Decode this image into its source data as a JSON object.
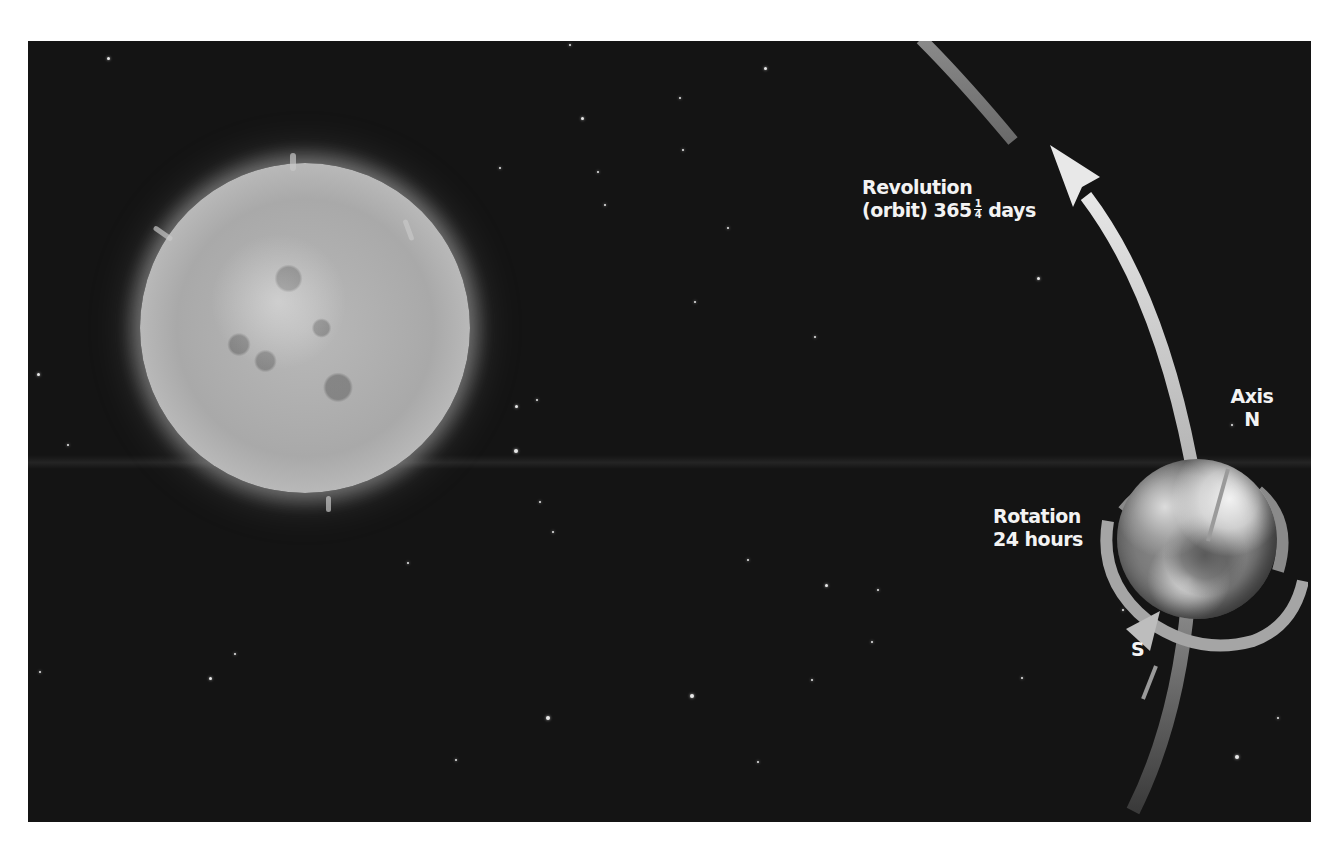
{
  "diagram": {
    "background_color": "#141414",
    "page_color": "#ffffff",
    "bodies": [
      {
        "name": "Sun",
        "icon": "sun-icon"
      },
      {
        "name": "Earth",
        "icon": "earth-icon"
      }
    ]
  },
  "labels": {
    "revolution": {
      "line1": "Revolution",
      "line2_prefix": "(orbit) 365",
      "fraction_numerator": "1",
      "fraction_denominator": "4",
      "line2_suffix": "days"
    },
    "rotation": {
      "line1": "Rotation",
      "line2": "24 hours"
    },
    "axis": {
      "title": "Axis",
      "north": "N",
      "south": "S"
    }
  },
  "stars": [
    [
      108,
      58,
      3
    ],
    [
      570,
      45,
      2
    ],
    [
      765,
      68,
      3
    ],
    [
      582,
      118,
      3
    ],
    [
      680,
      98,
      2
    ],
    [
      500,
      168,
      2
    ],
    [
      598,
      172,
      2
    ],
    [
      683,
      150,
      2
    ],
    [
      605,
      205,
      2
    ],
    [
      728,
      228,
      2
    ],
    [
      1038,
      278,
      3
    ],
    [
      695,
      302,
      2
    ],
    [
      815,
      337,
      2
    ],
    [
      38,
      374,
      3
    ],
    [
      537,
      400,
      2
    ],
    [
      516,
      406,
      3
    ],
    [
      68,
      445,
      2
    ],
    [
      516,
      451,
      4
    ],
    [
      540,
      502,
      2
    ],
    [
      553,
      532,
      2
    ],
    [
      408,
      563,
      2
    ],
    [
      1232,
      425,
      2
    ],
    [
      1262,
      510,
      2
    ],
    [
      748,
      560,
      2
    ],
    [
      826,
      585,
      3
    ],
    [
      878,
      590,
      2
    ],
    [
      235,
      654,
      2
    ],
    [
      40,
      672,
      2
    ],
    [
      210,
      678,
      3
    ],
    [
      692,
      696,
      4
    ],
    [
      548,
      718,
      4
    ],
    [
      1022,
      678,
      2
    ],
    [
      872,
      642,
      2
    ],
    [
      456,
      760,
      2
    ],
    [
      758,
      762,
      2
    ],
    [
      1237,
      757,
      4
    ],
    [
      1278,
      718,
      2
    ],
    [
      1123,
      610,
      2
    ],
    [
      1172,
      512,
      2
    ],
    [
      812,
      680,
      2
    ]
  ]
}
